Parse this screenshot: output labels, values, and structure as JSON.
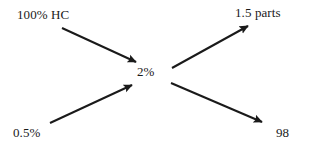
{
  "diagram": {
    "type": "flow-diagram",
    "background_color": "#ffffff",
    "stroke_color": "#1a1a1a",
    "nodes": {
      "input_top": "100% HC",
      "input_bottom": "0.5%",
      "center": "2%",
      "output_top": "1.5 parts",
      "output_bottom": "98"
    },
    "arrows": [
      {
        "name": "arrow-input-top-to-center",
        "from": "100% HC",
        "to": "2%",
        "direction": "down-right",
        "x1": 62,
        "y1": 28,
        "x2": 136,
        "y2": 62
      },
      {
        "name": "arrow-input-bottom-to-center",
        "from": "0.5%",
        "to": "2%",
        "direction": "up-right",
        "x1": 50,
        "y1": 123,
        "x2": 132,
        "y2": 85
      },
      {
        "name": "arrow-center-to-output-top",
        "from": "2%",
        "to": "1.5 parts",
        "direction": "up-right",
        "x1": 172,
        "y1": 68,
        "x2": 248,
        "y2": 26
      },
      {
        "name": "arrow-center-to-output-bottom",
        "from": "2%",
        "to": "98",
        "direction": "down-right",
        "x1": 171,
        "y1": 83,
        "x2": 262,
        "y2": 122
      }
    ]
  }
}
